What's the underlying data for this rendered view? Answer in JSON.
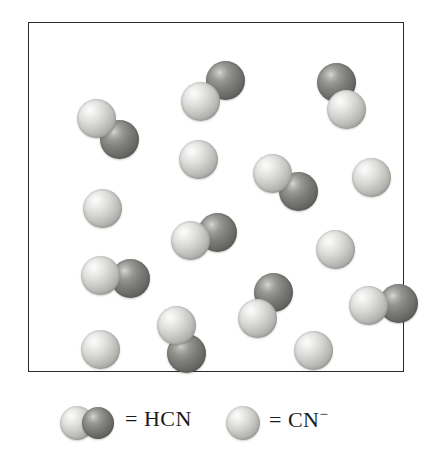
{
  "figure": {
    "kind": "molecular-particulate-diagram",
    "box": {
      "x": 28,
      "y": 22,
      "width": 376,
      "height": 350,
      "border_color": "#2a2a2a",
      "background": "#ffffff"
    },
    "colors": {
      "light_sphere": "#cfcfcc",
      "dark_sphere": "#757571",
      "outline": "#2a2a2a",
      "text": "#1b1b1b"
    },
    "sphere_diameter": 39,
    "counts": {
      "hcn_molecules": 8,
      "cn_minus_ions": 8,
      "total_particles": 16
    },
    "particles": [
      {
        "id": "hcn-1",
        "species": "HCN",
        "label": "HCN",
        "x": 48,
        "y": 76,
        "atoms": [
          {
            "type": "light",
            "dx": 0,
            "dy": 0
          },
          {
            "type": "dark",
            "dx": 23,
            "dy": 21
          }
        ]
      },
      {
        "id": "hcn-2",
        "species": "HCN",
        "label": "HCN",
        "x": 152,
        "y": 38,
        "atoms": [
          {
            "type": "light",
            "dx": 0,
            "dy": 21
          },
          {
            "type": "dark",
            "dx": 25,
            "dy": 0
          }
        ]
      },
      {
        "id": "hcn-3",
        "species": "HCN",
        "label": "HCN",
        "x": 288,
        "y": 40,
        "atoms": [
          {
            "type": "dark",
            "dx": 0,
            "dy": 0
          },
          {
            "type": "light",
            "dx": 10,
            "dy": 27
          }
        ]
      },
      {
        "id": "hcn-4",
        "species": "HCN",
        "label": "HCN",
        "x": 224,
        "y": 131,
        "atoms": [
          {
            "type": "light",
            "dx": 0,
            "dy": 0
          },
          {
            "type": "dark",
            "dx": 26,
            "dy": 18
          }
        ]
      },
      {
        "id": "hcn-5",
        "species": "HCN",
        "label": "HCN",
        "x": 142,
        "y": 190,
        "atoms": [
          {
            "type": "light",
            "dx": 0,
            "dy": 8
          },
          {
            "type": "dark",
            "dx": 27,
            "dy": 0
          }
        ]
      },
      {
        "id": "hcn-6",
        "species": "HCN",
        "label": "HCN",
        "x": 52,
        "y": 233,
        "atoms": [
          {
            "type": "light",
            "dx": 0,
            "dy": 0
          },
          {
            "type": "dark",
            "dx": 30,
            "dy": 3
          }
        ]
      },
      {
        "id": "hcn-7",
        "species": "HCN",
        "label": "HCN",
        "x": 209,
        "y": 250,
        "atoms": [
          {
            "type": "dark",
            "dx": 16,
            "dy": 0
          },
          {
            "type": "light",
            "dx": 0,
            "dy": 26
          }
        ]
      },
      {
        "id": "hcn-8",
        "species": "HCN",
        "label": "HCN",
        "x": 128,
        "y": 283,
        "atoms": [
          {
            "type": "light",
            "dx": 0,
            "dy": 0
          },
          {
            "type": "dark",
            "dx": 10,
            "dy": 28
          }
        ]
      },
      {
        "id": "hcn-9",
        "species": "HCN",
        "label": "HCN",
        "x": 320,
        "y": 261,
        "atoms": [
          {
            "type": "light",
            "dx": 0,
            "dy": 2
          },
          {
            "type": "dark",
            "dx": 30,
            "dy": 0
          }
        ]
      },
      {
        "id": "cn-1",
        "species": "CN-",
        "label": "CN⁻",
        "x": 150,
        "y": 117,
        "atoms": [
          {
            "type": "light",
            "dx": 0,
            "dy": 0
          }
        ]
      },
      {
        "id": "cn-2",
        "species": "CN-",
        "label": "CN⁻",
        "x": 54,
        "y": 166,
        "atoms": [
          {
            "type": "light",
            "dx": 0,
            "dy": 0
          }
        ]
      },
      {
        "id": "cn-3",
        "species": "CN-",
        "label": "CN⁻",
        "x": 323,
        "y": 135,
        "atoms": [
          {
            "type": "light",
            "dx": 0,
            "dy": 0
          }
        ]
      },
      {
        "id": "cn-4",
        "species": "CN-",
        "label": "CN⁻",
        "x": 287,
        "y": 207,
        "atoms": [
          {
            "type": "light",
            "dx": 0,
            "dy": 0
          }
        ]
      },
      {
        "id": "cn-5",
        "species": "CN-",
        "label": "CN⁻",
        "x": 52,
        "y": 307,
        "atoms": [
          {
            "type": "light",
            "dx": 0,
            "dy": 0
          }
        ]
      },
      {
        "id": "cn-6",
        "species": "CN-",
        "label": "CN⁻",
        "x": 265,
        "y": 308,
        "atoms": [
          {
            "type": "light",
            "dx": 0,
            "dy": 0
          }
        ]
      }
    ]
  },
  "legend": {
    "entries": [
      {
        "id": "hcn",
        "equals": "=",
        "label": "HCN",
        "charge": "",
        "swatch": "light-dark-pair"
      },
      {
        "id": "cn",
        "equals": "=",
        "label": "CN",
        "charge": "−",
        "swatch": "light-single"
      }
    ]
  }
}
